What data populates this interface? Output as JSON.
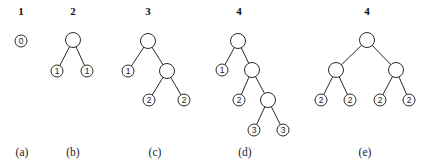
{
  "figure": {
    "panels": [
      {
        "id": "a",
        "caption": "(a)",
        "count": "1",
        "count_pos": [
          21,
          15
        ],
        "caption_pos": [
          22,
          156
        ],
        "nodes": [
          {
            "x": 21,
            "y": 41,
            "label": "0"
          }
        ],
        "edges": []
      },
      {
        "id": "b",
        "caption": "(b)",
        "count": "2",
        "count_pos": [
          73,
          15
        ],
        "caption_pos": [
          73,
          156
        ],
        "nodes": [
          {
            "x": 73,
            "y": 40,
            "label": ""
          },
          {
            "x": 57,
            "y": 71,
            "label": "1"
          },
          {
            "x": 87,
            "y": 71,
            "label": "1"
          }
        ],
        "edges": [
          [
            0,
            1
          ],
          [
            0,
            2
          ]
        ]
      },
      {
        "id": "c",
        "caption": "(c)",
        "count": "3",
        "count_pos": [
          148,
          15
        ],
        "caption_pos": [
          155,
          156
        ],
        "nodes": [
          {
            "x": 148,
            "y": 41,
            "label": ""
          },
          {
            "x": 128,
            "y": 71,
            "label": "1"
          },
          {
            "x": 167,
            "y": 71,
            "label": ""
          },
          {
            "x": 149,
            "y": 100,
            "label": "2"
          },
          {
            "x": 184,
            "y": 100,
            "label": "2"
          }
        ],
        "edges": [
          [
            0,
            1
          ],
          [
            0,
            2
          ],
          [
            2,
            3
          ],
          [
            2,
            4
          ]
        ]
      },
      {
        "id": "d",
        "caption": "(d)",
        "count": "4",
        "count_pos": [
          239,
          15
        ],
        "caption_pos": [
          245,
          156
        ],
        "nodes": [
          {
            "x": 238,
            "y": 41,
            "label": ""
          },
          {
            "x": 222,
            "y": 70,
            "label": "1"
          },
          {
            "x": 252,
            "y": 70,
            "label": ""
          },
          {
            "x": 239,
            "y": 100,
            "label": "2"
          },
          {
            "x": 268,
            "y": 100,
            "label": ""
          },
          {
            "x": 254,
            "y": 130,
            "label": "3"
          },
          {
            "x": 283,
            "y": 130,
            "label": "3"
          }
        ],
        "edges": [
          [
            0,
            1
          ],
          [
            0,
            2
          ],
          [
            2,
            3
          ],
          [
            2,
            4
          ],
          [
            4,
            5
          ],
          [
            4,
            6
          ]
        ]
      },
      {
        "id": "e",
        "caption": "(e)",
        "count": "4",
        "count_pos": [
          367,
          15
        ],
        "caption_pos": [
          365,
          156
        ],
        "nodes": [
          {
            "x": 367,
            "y": 40,
            "label": ""
          },
          {
            "x": 336,
            "y": 70,
            "label": ""
          },
          {
            "x": 396,
            "y": 70,
            "label": ""
          },
          {
            "x": 321,
            "y": 100,
            "label": "2"
          },
          {
            "x": 350,
            "y": 100,
            "label": "2"
          },
          {
            "x": 380,
            "y": 100,
            "label": "2"
          },
          {
            "x": 409,
            "y": 100,
            "label": "2"
          }
        ],
        "edges": [
          [
            0,
            1
          ],
          [
            0,
            2
          ],
          [
            1,
            3
          ],
          [
            1,
            4
          ],
          [
            2,
            5
          ],
          [
            2,
            6
          ]
        ]
      }
    ],
    "style": {
      "inner_node_radius": 7.5,
      "leaf_node_radius": 6,
      "stroke_color": "#2a2a2a",
      "background": "#ffffff"
    }
  }
}
